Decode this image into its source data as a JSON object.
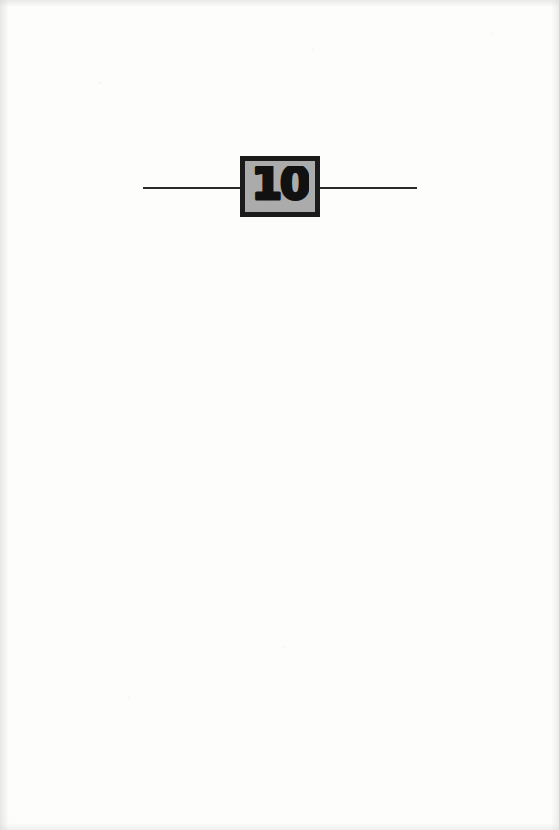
{
  "page": {
    "kind": "book-chapter-divider-page",
    "background_color": "#fdfdfc",
    "width": 559,
    "height": 830
  },
  "divider": {
    "rule_color": "#2b2b2b",
    "left_rule": {
      "name": "left-rule"
    },
    "right_rule": {
      "name": "right-rule"
    }
  },
  "chapter_badge": {
    "number": "10",
    "fill_color": "#ababab",
    "border_color": "#1a1a1a",
    "number_color": "#111111"
  }
}
